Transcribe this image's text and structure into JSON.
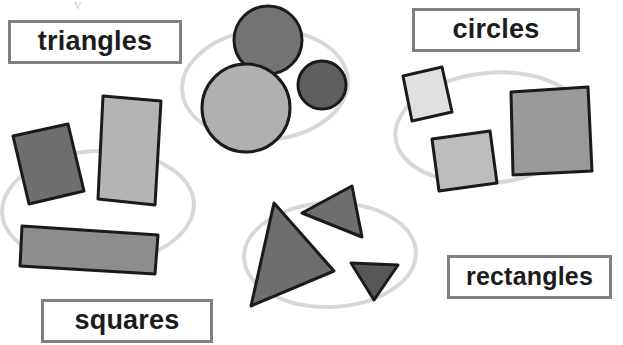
{
  "page": {
    "background_color": "#ffffff",
    "width": 623,
    "height": 345
  },
  "labels": {
    "triangles": "triangles",
    "circles": "circles",
    "rectangles": "rectangles",
    "squares": "squares"
  },
  "style": {
    "label_border_color": "#808080",
    "label_fill_color": "#ffffff",
    "label_text_color": "#1c1c1c",
    "shape_outline_color": "#1a1a1a",
    "group_ring_color": "#d8d8d8",
    "tick_mark_color": "#cfcfcf"
  },
  "groups": [
    {
      "name": "circles-group",
      "ring": {
        "cx": 265,
        "cy": 85,
        "rx": 83,
        "ry": 55,
        "rotate": -4
      },
      "shapes": [
        {
          "kind": "circle",
          "cx": 268,
          "cy": 40,
          "r": 34,
          "fill": "#737373"
        },
        {
          "kind": "circle",
          "cx": 246,
          "cy": 108,
          "r": 44,
          "fill": "#b0b0b0"
        },
        {
          "kind": "circle",
          "cx": 322,
          "cy": 85,
          "r": 24,
          "fill": "#5f5f5f"
        }
      ]
    },
    {
      "name": "rectangles-group",
      "ring": {
        "cx": 98,
        "cy": 208,
        "rx": 96,
        "ry": 57,
        "rotate": -3
      },
      "shapes": [
        {
          "kind": "polygon",
          "fill": "#6e6e6e",
          "points": "13,136 68,124 84,191 29,204"
        },
        {
          "kind": "polygon",
          "fill": "#b4b4b4",
          "points": "103,96 161,101 155,205 98,199"
        },
        {
          "kind": "polygon",
          "fill": "#8d8d8d",
          "points": "22,226 158,235 155,274 20,266"
        }
      ]
    },
    {
      "name": "squares-group",
      "ring": {
        "cx": 490,
        "cy": 128,
        "rx": 95,
        "ry": 55,
        "rotate": -6
      },
      "shapes": [
        {
          "kind": "polygon",
          "fill": "#e0e0e0",
          "points": "403,76 442,67 452,112 412,121"
        },
        {
          "kind": "polygon",
          "fill": "#bdbdbd",
          "points": "432,139 490,131 497,183 439,191"
        },
        {
          "kind": "polygon",
          "fill": "#9a9a9a",
          "points": "511,92 588,87 592,171 513,175"
        }
      ]
    },
    {
      "name": "triangles-group",
      "ring": {
        "cx": 330,
        "cy": 255,
        "rx": 86,
        "ry": 52,
        "rotate": -2
      },
      "shapes": [
        {
          "kind": "polygon",
          "fill": "#6e6e6e",
          "points": "352,186 362,237 302,213"
        },
        {
          "kind": "polygon",
          "fill": "#6e6e6e",
          "points": "274,203 334,271 251,306"
        },
        {
          "kind": "polygon",
          "fill": "#585858",
          "points": "351,263 398,265 374,300"
        }
      ]
    }
  ],
  "marks": [
    {
      "name": "tick-mark",
      "glyph": "v",
      "x": 74,
      "y": -3
    }
  ]
}
